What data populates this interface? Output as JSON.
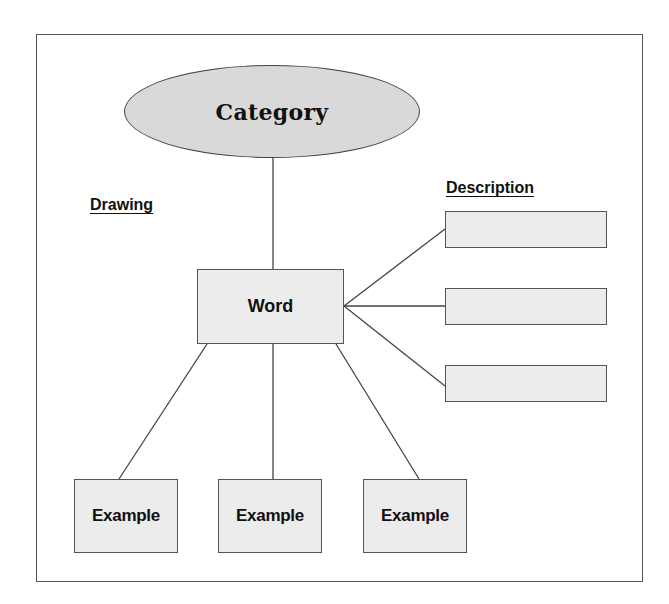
{
  "diagram": {
    "category": {
      "label": "Category"
    },
    "word": {
      "label": "Word"
    },
    "labels": {
      "drawing": "Drawing",
      "description": "Description"
    },
    "description_boxes": [
      {
        "label": ""
      },
      {
        "label": ""
      },
      {
        "label": ""
      }
    ],
    "examples": [
      {
        "label": "Example"
      },
      {
        "label": "Example"
      },
      {
        "label": "Example"
      }
    ],
    "colors": {
      "ellipse_fill": "#d9d9d9",
      "box_fill": "#ececec",
      "stroke": "#444444"
    }
  }
}
